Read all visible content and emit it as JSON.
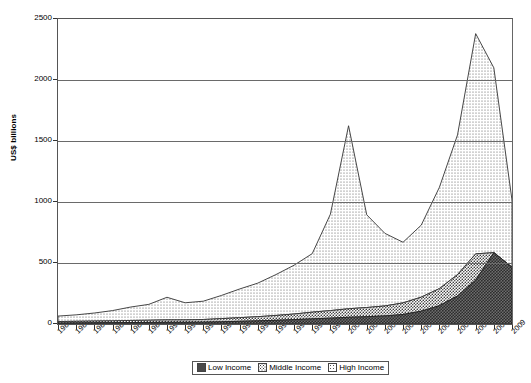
{
  "chart": {
    "ylabel": "US$ billions",
    "yticks": [
      "0",
      "500",
      "1000",
      "1500",
      "2000",
      "2500"
    ],
    "legend": [
      {
        "label": "Low Income",
        "key": "low"
      },
      {
        "label": "Middle Income",
        "key": "middle"
      },
      {
        "label": "High Income",
        "key": "high"
      }
    ]
  },
  "chart_data": {
    "type": "area",
    "stacked": true,
    "title": "",
    "xlabel": "",
    "ylabel": "US$ billions",
    "ylim": [
      0,
      2500
    ],
    "yticks": [
      0,
      500,
      1000,
      1500,
      2000,
      2500
    ],
    "grid": true,
    "legend_position": "bottom",
    "categories": [
      "1984",
      "1985",
      "1986",
      "1987",
      "1988",
      "1989",
      "1990",
      "1991",
      "1992",
      "1993",
      "1994",
      "1995",
      "1996",
      "1997",
      "1998",
      "1999",
      "2000",
      "2001",
      "2002",
      "2003",
      "2004",
      "2005",
      "2006",
      "2007",
      "2008",
      "2009"
    ],
    "series": [
      {
        "name": "Low Income",
        "values": [
          8,
          9,
          10,
          11,
          12,
          13,
          14,
          14,
          15,
          18,
          22,
          26,
          30,
          36,
          42,
          48,
          55,
          60,
          66,
          78,
          105,
          150,
          230,
          360,
          585,
          465
        ]
      },
      {
        "name": "Middle Income",
        "values": [
          12,
          13,
          14,
          15,
          17,
          18,
          20,
          20,
          22,
          26,
          30,
          34,
          40,
          46,
          55,
          62,
          70,
          75,
          82,
          95,
          115,
          140,
          175,
          215,
          0,
          0
        ]
      },
      {
        "name": "High Income",
        "values": [
          45,
          53,
          66,
          84,
          110,
          130,
          185,
          140,
          150,
          190,
          235,
          275,
          335,
          400,
          480,
          790,
          1500,
          760,
          595,
          497,
          590,
          830,
          1145,
          1805,
          0,
          550
        ]
      }
    ],
    "totals": [
      65,
      75,
      90,
      110,
      139,
      161,
      219,
      174,
      187,
      234,
      287,
      335,
      405,
      482,
      577,
      900,
      1625,
      895,
      743,
      670,
      810,
      1120,
      1550,
      2380,
      2100,
      1015
    ],
    "annotations": [
      {
        "x": "2000",
        "y": 1625,
        "note": "first peak"
      },
      {
        "x": "2007",
        "y": 2380,
        "note": "global peak"
      },
      {
        "x": "2003",
        "y": 670,
        "note": "trough"
      }
    ]
  }
}
